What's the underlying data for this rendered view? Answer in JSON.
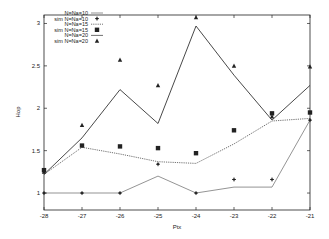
{
  "chart_data": {
    "type": "line",
    "title": "",
    "xlabel": "Ptx",
    "ylabel": "Hop",
    "xlim": [
      -28,
      -21
    ],
    "ylim": [
      0.8,
      3.1
    ],
    "x": [
      -28,
      -27,
      -26,
      -25,
      -24,
      -23,
      -22,
      -21
    ],
    "xticks": [
      "-28",
      "-27",
      "-26",
      "-25",
      "-24",
      "-23",
      "-22",
      "-21"
    ],
    "yticks": [
      "1",
      "1.5",
      "2",
      "2.5",
      "3"
    ],
    "ytick_values": [
      1,
      1.5,
      2,
      2.5,
      3
    ],
    "grid": false,
    "legend_position": "upper-left",
    "series": [
      {
        "name": "N=Na=10",
        "style": "line-solid-thin",
        "values": [
          1.0,
          1.0,
          1.0,
          1.2,
          1.0,
          1.07,
          1.07,
          1.86
        ]
      },
      {
        "name": "sim N=Na=10",
        "style": "marker-diamond",
        "values": [
          1.0,
          1.0,
          1.0,
          1.34,
          1.0,
          1.16,
          1.16,
          1.86
        ]
      },
      {
        "name": "N=Na=15",
        "style": "line-dotted",
        "values": [
          1.22,
          1.54,
          1.46,
          1.37,
          1.35,
          1.58,
          1.85,
          1.88
        ]
      },
      {
        "name": "sim N=Na=15",
        "style": "marker-square",
        "values": [
          1.27,
          1.56,
          1.55,
          1.53,
          1.47,
          1.74,
          1.94,
          1.95
        ]
      },
      {
        "name": "N=Na=20",
        "style": "line-solid",
        "values": [
          1.22,
          1.65,
          2.22,
          1.82,
          2.97,
          2.39,
          1.86,
          2.27
        ]
      },
      {
        "name": "sim N=Na=20",
        "style": "marker-triangle",
        "values": [
          1.25,
          1.8,
          2.57,
          2.27,
          3.07,
          2.5,
          1.9,
          2.49
        ]
      }
    ]
  },
  "colors": {
    "axis": "#222222",
    "series_line": "#333333",
    "series_thin": "#555555",
    "background": "#ffffff"
  }
}
